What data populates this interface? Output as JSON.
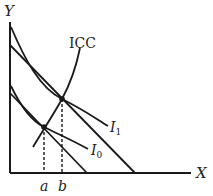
{
  "diagram": {
    "axes": {
      "x_label": "X",
      "y_label": "Y"
    },
    "curves": [
      {
        "id": "I1",
        "label": "I",
        "subscript": "1",
        "type": "indifference curve"
      },
      {
        "id": "I0",
        "label": "I",
        "subscript": "0",
        "type": "indifference curve"
      },
      {
        "id": "ICC",
        "label": "ICC",
        "type": "income-consumption curve"
      }
    ],
    "budget_lines": [
      "lower budget line",
      "upper budget line"
    ],
    "x_markers": [
      {
        "label": "a",
        "position": "lower tangency"
      },
      {
        "label": "b",
        "position": "upper tangency"
      }
    ],
    "colors": {
      "line": "#1a1a1a",
      "text": "#222222"
    }
  }
}
